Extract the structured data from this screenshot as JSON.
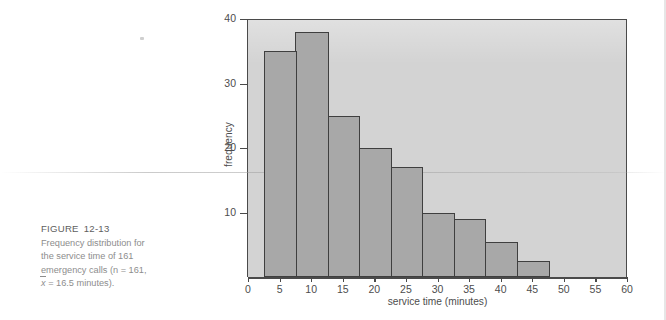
{
  "figure": {
    "label": "FIGURE",
    "number": "12-13",
    "caption_lines": [
      "Frequency distribution for",
      "the service time of 161",
      "emergency calls (n = 161,",
      "x = 16.5 minutes)."
    ],
    "caption_full": "Frequency distribution for the service time of 161 emergency calls (n = 161, x̄ = 16.5 minutes)."
  },
  "colors": {
    "bar_fill": "#a8a8a8",
    "bar_stroke": "#3f3f3f",
    "plot_background": "#d3d3d3",
    "page_background": "#ffffff",
    "caption_text": "#8d8d8d",
    "axis_text": "#4d4d4d"
  },
  "chart_data": {
    "type": "bar",
    "title": "",
    "subtitle": "",
    "xlabel": "service time (minutes)",
    "ylabel": "frequency",
    "xlim": [
      0,
      60
    ],
    "ylim": [
      0,
      40
    ],
    "xticks": [
      0,
      5,
      10,
      15,
      20,
      25,
      30,
      35,
      40,
      45,
      50,
      55,
      60
    ],
    "yticks": [
      10,
      20,
      30,
      40
    ],
    "xtick_labels": [
      "0",
      "5",
      "10",
      "15",
      "20",
      "25",
      "30",
      "35",
      "40",
      "45",
      "50",
      "55",
      "60"
    ],
    "ytick_labels": [
      "10",
      "20",
      "30",
      "40"
    ],
    "grid": false,
    "legend": null,
    "bin_width": 5,
    "bin_edges": [
      2.5,
      7.5,
      12.5,
      17.5,
      22.5,
      27.5,
      32.5,
      37.5,
      42.5,
      47.5
    ],
    "bin_midpoints": [
      5,
      10,
      15,
      20,
      25,
      30,
      35,
      40,
      45
    ],
    "categories": [
      "5",
      "10",
      "15",
      "20",
      "25",
      "30",
      "35",
      "40",
      "45"
    ],
    "values": [
      35,
      38,
      25,
      20,
      17,
      10,
      9,
      5.5,
      2.5
    ],
    "n": 161,
    "mean": 16.5,
    "annotations": []
  }
}
